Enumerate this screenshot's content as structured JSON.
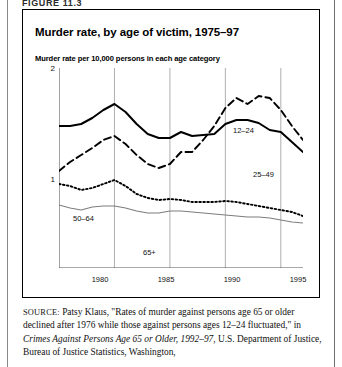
{
  "figure": {
    "label": "FIGURE 11.3"
  },
  "card": {
    "title": "Murder rate, by age of victim, 1975–97",
    "subtitle": "Murder rate per 10,000 persons in each age category"
  },
  "source": {
    "prefix": "SOURCE:",
    "line1": " Patsy Klaus, \"Rates of murder against persons age 65 or",
    "line2": "older declined after 1976 while those against persons ages 12–24",
    "line3a": "fluctuated,\" in ",
    "line3_italic": "Crimes Against Persons Age 65 or Older, 1992–97",
    "line3b": ",",
    "line4": "U.S. Department of Justice, Bureau of Justice Statistics, Washington,"
  },
  "series_labels": {
    "age_12_24": "12–24",
    "age_25_49": "25–49",
    "age_50_64": "50–64",
    "age_65_plus": "65+"
  },
  "colors": {
    "ink": "#000000",
    "grid": "#9a9a9a",
    "axis": "#555555",
    "series_65plus": "#7d7d7d",
    "frame": "#8a8a8a"
  },
  "chart_data": {
    "type": "line",
    "title": "Murder rate, by age of victim, 1975–97",
    "subtitle": "Murder rate per 10,000 persons in each age category",
    "xlabel": "",
    "ylabel": "Murder rate per 10,000 persons in each age category",
    "xlim": [
      1975,
      1997
    ],
    "ylim": [
      0,
      2
    ],
    "yticks": [
      1,
      2
    ],
    "ytick_labels": [
      "1",
      "2"
    ],
    "y_minor_ticks": [
      0.25,
      0.5,
      0.75,
      1.25,
      1.5,
      1.75
    ],
    "xticks": [
      1980,
      1985,
      1990,
      1995
    ],
    "xtick_labels": [
      "1980",
      "1985",
      "1990",
      "1995"
    ],
    "grid": "vertical",
    "legend": "inline-annotations",
    "x": [
      1975,
      1976,
      1977,
      1978,
      1979,
      1980,
      1981,
      1982,
      1983,
      1984,
      1985,
      1986,
      1987,
      1988,
      1989,
      1990,
      1991,
      1992,
      1993,
      1994,
      1995,
      1996,
      1997
    ],
    "series": [
      {
        "name": "25–49",
        "label": "25–49",
        "style": "solid-thick",
        "color": "#000000",
        "values": [
          1.42,
          1.42,
          1.44,
          1.5,
          1.58,
          1.64,
          1.56,
          1.44,
          1.34,
          1.3,
          1.3,
          1.36,
          1.32,
          1.33,
          1.34,
          1.44,
          1.48,
          1.48,
          1.45,
          1.38,
          1.36,
          1.26,
          1.16
        ]
      },
      {
        "name": "12–24",
        "label": "12–24",
        "style": "dashed",
        "color": "#000000",
        "values": [
          0.97,
          1.06,
          1.13,
          1.2,
          1.28,
          1.32,
          1.24,
          1.13,
          1.04,
          1.0,
          1.04,
          1.16,
          1.16,
          1.28,
          1.42,
          1.6,
          1.7,
          1.64,
          1.72,
          1.7,
          1.58,
          1.42,
          1.28
        ]
      },
      {
        "name": "50–64",
        "label": "50–64",
        "style": "dotted",
        "color": "#000000",
        "values": [
          0.84,
          0.82,
          0.78,
          0.8,
          0.84,
          0.88,
          0.82,
          0.74,
          0.7,
          0.68,
          0.69,
          0.68,
          0.66,
          0.66,
          0.66,
          0.67,
          0.66,
          0.64,
          0.62,
          0.6,
          0.58,
          0.56,
          0.52
        ]
      },
      {
        "name": "65+",
        "label": "65+",
        "style": "solid-thin-gray",
        "color": "#7d7d7d",
        "values": [
          0.63,
          0.6,
          0.58,
          0.61,
          0.62,
          0.62,
          0.6,
          0.57,
          0.55,
          0.55,
          0.57,
          0.57,
          0.56,
          0.55,
          0.54,
          0.53,
          0.52,
          0.51,
          0.51,
          0.5,
          0.48,
          0.46,
          0.45
        ]
      }
    ]
  }
}
